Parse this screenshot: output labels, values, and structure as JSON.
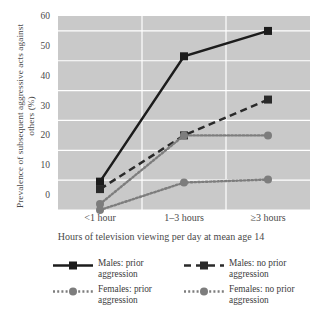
{
  "chart_data": {
    "type": "line",
    "title": "",
    "xlabel": "Hours of television viewing per day at mean age 14",
    "ylabel": "Prevalence of subsequent aggressive acts against others (%)",
    "categories": [
      "<1 hour",
      "1–3 hours",
      "≥3 hours"
    ],
    "ylim": [
      0,
      65
    ],
    "yticks": [
      0,
      10,
      20,
      30,
      40,
      50,
      60
    ],
    "ytick_labels": [
      "0",
      "10",
      "20",
      "30",
      "40",
      "50",
      "60"
    ],
    "grid": true,
    "legend_position": "bottom",
    "series": [
      {
        "name": "Males: prior aggression",
        "label_line1": "Males: prior",
        "label_line2": "aggression",
        "values": [
          9.5,
          51.5,
          60.0
        ],
        "style": "solid",
        "marker": "square",
        "color": "#1c1c1c"
      },
      {
        "name": "Males: no prior aggression",
        "label_line1": "Males: no prior",
        "label_line2": "aggression",
        "values": [
          7.0,
          25.0,
          37.0
        ],
        "style": "dashed",
        "marker": "square",
        "color": "#2a2a2a"
      },
      {
        "name": "Females: prior aggression",
        "label_line1": "Females: prior",
        "label_line2": "aggression",
        "values": [
          2.0,
          25.0,
          25.0
        ],
        "style": "dotted",
        "marker": "circle",
        "color": "#7d7d7d"
      },
      {
        "name": "Females: no prior aggression",
        "label_line1": "Females: no prior",
        "label_line2": "aggression",
        "values": [
          0.0,
          9.2,
          10.2
        ],
        "style": "dotted",
        "marker": "circle",
        "color": "#7d7d7d"
      }
    ],
    "colors": {
      "plot_background": "#c9c9c9",
      "gridline": "#ffffff",
      "text": "#4a4a4a",
      "series_dark": "#1c1c1c",
      "series_gray": "#7d7d7d",
      "page_background": "#ffffff"
    }
  }
}
